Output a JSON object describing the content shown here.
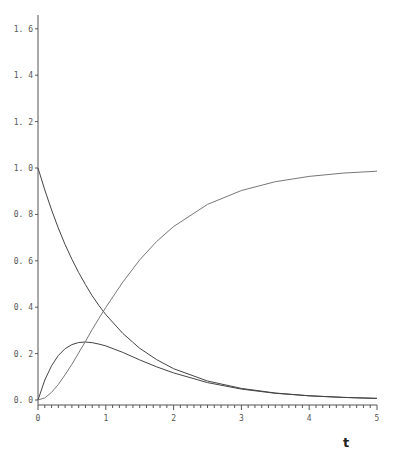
{
  "chart_data": {
    "type": "line",
    "title": "",
    "xlabel": "t",
    "ylabel": "",
    "xlim": [
      0,
      5
    ],
    "ylim": [
      0,
      1.6
    ],
    "grid": false,
    "legend": null,
    "x_ticks": [
      "0",
      "1",
      "2",
      "3",
      "4",
      "5"
    ],
    "x_minor_step": 0.1,
    "y_ticks": [
      "0.0",
      "0.2",
      "0.4",
      "0.6",
      "0.8",
      "1.0",
      "1.2",
      "1.4",
      "1.6"
    ],
    "x": [
      0,
      0.1,
      0.2,
      0.3,
      0.4,
      0.5,
      0.6,
      0.7,
      0.8,
      0.9,
      1.0,
      1.25,
      1.5,
      1.75,
      2.0,
      2.5,
      3.0,
      3.5,
      4.0,
      4.5,
      5.0
    ],
    "series": [
      {
        "name": "A (decaying)",
        "values": [
          1.0,
          0.905,
          0.819,
          0.741,
          0.67,
          0.607,
          0.549,
          0.497,
          0.449,
          0.407,
          0.368,
          0.287,
          0.223,
          0.174,
          0.135,
          0.082,
          0.05,
          0.03,
          0.018,
          0.011,
          0.007
        ]
      },
      {
        "name": "B (intermediate)",
        "values": [
          0.0,
          0.086,
          0.148,
          0.192,
          0.221,
          0.239,
          0.248,
          0.25,
          0.247,
          0.241,
          0.233,
          0.205,
          0.173,
          0.143,
          0.117,
          0.075,
          0.047,
          0.029,
          0.018,
          0.011,
          0.007
        ]
      },
      {
        "name": "C (product)",
        "values": [
          0.0,
          0.009,
          0.033,
          0.067,
          0.109,
          0.154,
          0.203,
          0.253,
          0.304,
          0.352,
          0.399,
          0.508,
          0.604,
          0.683,
          0.748,
          0.843,
          0.903,
          0.941,
          0.964,
          0.978,
          0.986
        ]
      }
    ]
  }
}
